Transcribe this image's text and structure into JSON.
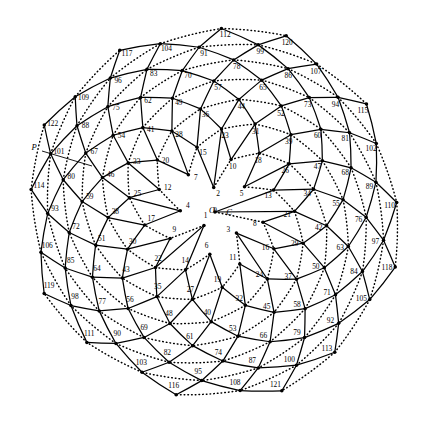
{
  "figure": {
    "type": "diagram",
    "background_color": "#ffffff",
    "line_color": "#000000",
    "center": {
      "x": 215,
      "y": 212
    },
    "spiral": {
      "divergence_angle_deg": 137.5,
      "scale_c": 17.35,
      "rotation_offset_deg": -8,
      "handedness": "clockwise"
    },
    "node_count": 123,
    "node_label_min": 0,
    "node_label_max": 122,
    "parastichy_families": {
      "solid": [
        13,
        21
      ],
      "dotted": [
        8
      ]
    },
    "annotations": [
      {
        "name": "origin-label",
        "text": "O",
        "x": 212,
        "y": 211
      },
      {
        "name": "point-c-label",
        "text": "C",
        "x": 229,
        "y": 213
      },
      {
        "name": "point-p-label",
        "text": "P",
        "x": 34,
        "y": 148
      }
    ],
    "leader_line": {
      "from_x": 42,
      "from_y": 151,
      "to_x": 92,
      "to_y": 166
    },
    "node_labels": [
      "0",
      "1",
      "2",
      "3",
      "4",
      "5",
      "6",
      "7",
      "8",
      "9",
      "10",
      "11",
      "12",
      "13",
      "14",
      "15",
      "16",
      "17",
      "18",
      "19",
      "20",
      "21",
      "22",
      "23",
      "24",
      "25",
      "26",
      "27",
      "28",
      "29",
      "30",
      "31",
      "32",
      "33",
      "34",
      "35",
      "36",
      "37",
      "38",
      "39",
      "40",
      "41",
      "42",
      "43",
      "44",
      "45",
      "46",
      "47",
      "48",
      "49",
      "50",
      "51",
      "52",
      "53",
      "54",
      "55",
      "56",
      "57",
      "58",
      "59",
      "60",
      "61",
      "62",
      "63",
      "64",
      "65",
      "66",
      "67",
      "68",
      "69",
      "70",
      "71",
      "72",
      "73",
      "74",
      "75",
      "76",
      "77",
      "78",
      "79",
      "80",
      "81",
      "82",
      "83",
      "84",
      "85",
      "86",
      "87",
      "88",
      "89",
      "90",
      "91",
      "92",
      "93",
      "94",
      "95",
      "96",
      "97",
      "98",
      "99",
      "100",
      "101",
      "102",
      "103",
      "104",
      "105",
      "106",
      "107",
      "108",
      "109",
      "110",
      "111",
      "112",
      "113",
      "114",
      "115",
      "116",
      "117",
      "118",
      "119",
      "120",
      "121",
      "122"
    ],
    "edge_styles": {
      "solid_stroke_width": 1.25,
      "dotted_stroke_width": 1.5,
      "dotted_dasharray": "0.6 3.1"
    },
    "label_offset_px": 7.4,
    "dot_radius_px": 1.75
  }
}
